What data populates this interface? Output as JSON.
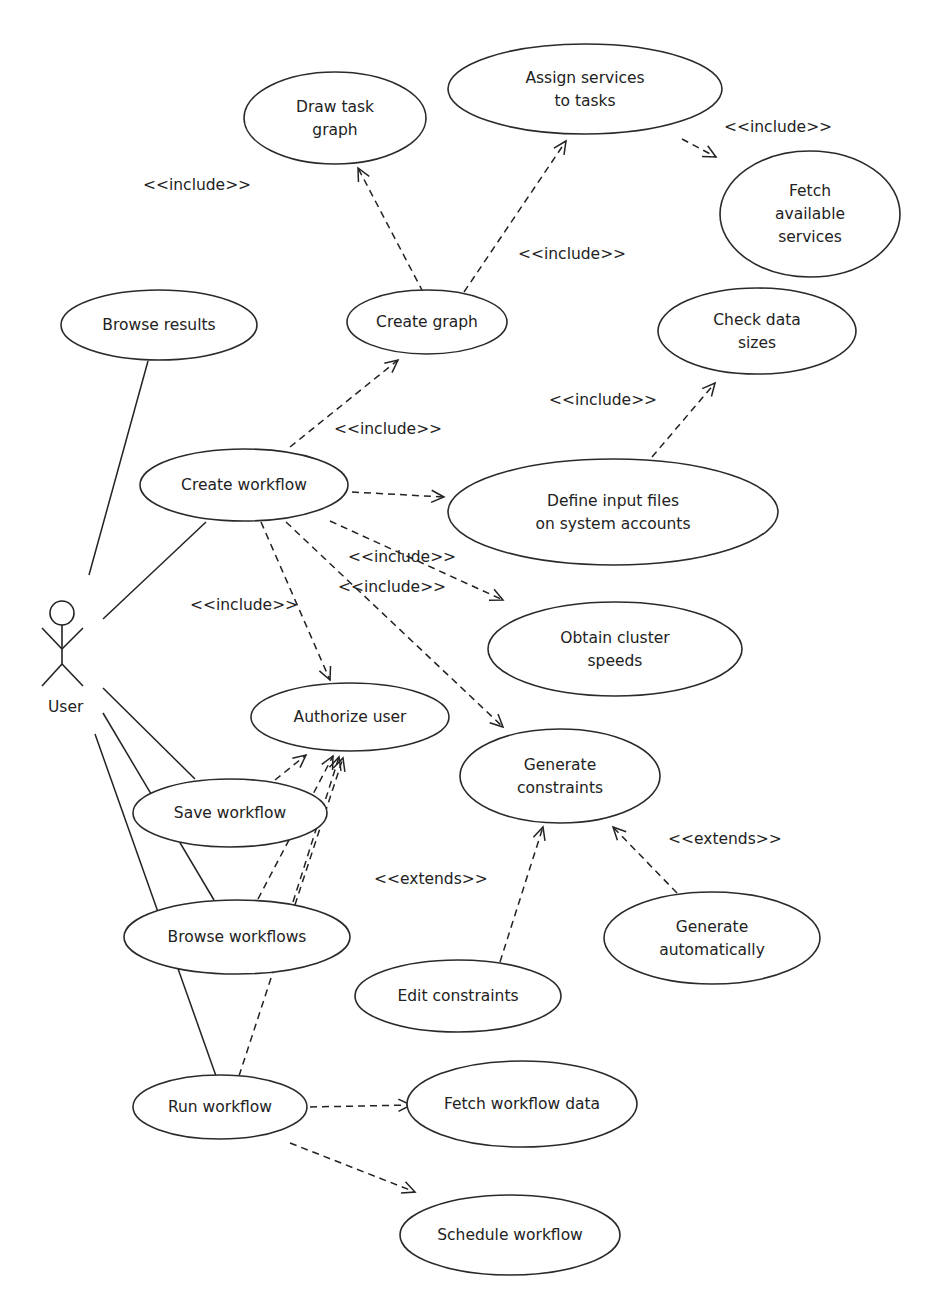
{
  "diagram": {
    "type": "uml-use-case",
    "actor": {
      "id": "user",
      "label": "User",
      "x": 62,
      "y": 640
    },
    "use_cases": [
      {
        "id": "draw_task_graph",
        "lines": [
          "Draw task",
          "graph"
        ],
        "cx": 335,
        "cy": 118,
        "rx": 91,
        "ry": 46
      },
      {
        "id": "assign_services",
        "lines": [
          "Assign services",
          "to tasks"
        ],
        "cx": 585,
        "cy": 89,
        "rx": 137,
        "ry": 45
      },
      {
        "id": "fetch_services",
        "lines": [
          "Fetch",
          "available",
          "services"
        ],
        "cx": 810,
        "cy": 214,
        "rx": 90,
        "ry": 63
      },
      {
        "id": "browse_results",
        "lines": [
          "Browse results"
        ],
        "cx": 159,
        "cy": 325,
        "rx": 98,
        "ry": 35
      },
      {
        "id": "create_graph",
        "lines": [
          "Create graph"
        ],
        "cx": 427,
        "cy": 322,
        "rx": 80,
        "ry": 32
      },
      {
        "id": "check_data_sizes",
        "lines": [
          "Check data",
          "sizes"
        ],
        "cx": 757,
        "cy": 331,
        "rx": 99,
        "ry": 43
      },
      {
        "id": "create_workflow",
        "lines": [
          "Create workflow"
        ],
        "cx": 244,
        "cy": 485,
        "rx": 104,
        "ry": 36
      },
      {
        "id": "define_input_files",
        "lines": [
          "Define input files",
          "on system accounts"
        ],
        "cx": 613,
        "cy": 512,
        "rx": 165,
        "ry": 53
      },
      {
        "id": "obtain_cluster_speeds",
        "lines": [
          "Obtain cluster",
          "speeds"
        ],
        "cx": 615,
        "cy": 649,
        "rx": 127,
        "ry": 47
      },
      {
        "id": "authorize_user",
        "lines": [
          "Authorize user"
        ],
        "cx": 350,
        "cy": 717,
        "rx": 99,
        "ry": 34
      },
      {
        "id": "generate_constraints",
        "lines": [
          "Generate",
          "constraints"
        ],
        "cx": 560,
        "cy": 776,
        "rx": 100,
        "ry": 47
      },
      {
        "id": "save_workflow",
        "lines": [
          "Save workflow"
        ],
        "cx": 230,
        "cy": 813,
        "rx": 97,
        "ry": 34
      },
      {
        "id": "browse_workflows",
        "lines": [
          "Browse workflows"
        ],
        "cx": 237,
        "cy": 937,
        "rx": 113,
        "ry": 37
      },
      {
        "id": "generate_automatically",
        "lines": [
          "Generate",
          "automatically"
        ],
        "cx": 712,
        "cy": 938,
        "rx": 108,
        "ry": 46
      },
      {
        "id": "edit_constraints",
        "lines": [
          "Edit constraints"
        ],
        "cx": 458,
        "cy": 996,
        "rx": 103,
        "ry": 36
      },
      {
        "id": "run_workflow",
        "lines": [
          "Run workflow"
        ],
        "cx": 220,
        "cy": 1107,
        "rx": 87,
        "ry": 32
      },
      {
        "id": "fetch_workflow_data",
        "lines": [
          "Fetch workflow data"
        ],
        "cx": 522,
        "cy": 1104,
        "rx": 115,
        "ry": 43
      },
      {
        "id": "schedule_workflow",
        "lines": [
          "Schedule workflow"
        ],
        "cx": 510,
        "cy": 1235,
        "rx": 110,
        "ry": 40
      }
    ],
    "associations": [
      {
        "from": "user",
        "to": "browse_results",
        "x1": 89,
        "y1": 575,
        "x2": 148,
        "y2": 361
      },
      {
        "from": "user",
        "to": "create_workflow",
        "x1": 103,
        "y1": 619,
        "x2": 206,
        "y2": 522
      },
      {
        "from": "user",
        "to": "save_workflow",
        "x1": 103,
        "y1": 688,
        "x2": 195,
        "y2": 779
      },
      {
        "from": "user",
        "to": "browse_workflows",
        "x1": 103,
        "y1": 713,
        "x2": 214,
        "y2": 900
      },
      {
        "from": "user",
        "to": "run_workflow",
        "x1": 95,
        "y1": 734,
        "x2": 216,
        "y2": 1076
      }
    ],
    "dependencies": [
      {
        "from": "create_graph",
        "to": "draw_task_graph",
        "x1": 423,
        "y1": 292,
        "x2": 358,
        "y2": 168,
        "stereotype": "include"
      },
      {
        "from": "create_graph",
        "to": "assign_services",
        "x1": 464,
        "y1": 292,
        "x2": 566,
        "y2": 141,
        "stereotype": "include"
      },
      {
        "from": "assign_services",
        "to": "fetch_services",
        "x1": 682,
        "y1": 139,
        "x2": 716,
        "y2": 157,
        "stereotype": "include"
      },
      {
        "from": "create_workflow",
        "to": "create_graph",
        "x1": 290,
        "y1": 447,
        "x2": 398,
        "y2": 360,
        "stereotype": "include"
      },
      {
        "from": "define_input_files",
        "to": "check_data_sizes",
        "x1": 652,
        "y1": 457,
        "x2": 715,
        "y2": 383,
        "stereotype": "include"
      },
      {
        "from": "create_workflow",
        "to": "define_input_files",
        "x1": 352,
        "y1": 492,
        "x2": 444,
        "y2": 497,
        "stereotype": "include"
      },
      {
        "from": "create_workflow",
        "to": "obtain_cluster_speeds",
        "x1": 330,
        "y1": 521,
        "x2": 503,
        "y2": 600,
        "stereotype": "include"
      },
      {
        "from": "create_workflow",
        "to": "generate_constraints",
        "x1": 286,
        "y1": 522,
        "x2": 503,
        "y2": 727,
        "stereotype": "include"
      },
      {
        "from": "create_workflow",
        "to": "authorize_user",
        "x1": 261,
        "y1": 522,
        "x2": 330,
        "y2": 680,
        "stereotype": "include"
      },
      {
        "from": "save_workflow",
        "to": "authorize_user",
        "x1": 275,
        "y1": 780,
        "x2": 306,
        "y2": 755,
        "stereotype": "include"
      },
      {
        "from": "browse_workflows",
        "to": "authorize_user",
        "x1": 258,
        "y1": 899,
        "x2": 333,
        "y2": 756,
        "stereotype": "include"
      },
      {
        "from": "browse_workflows",
        "to": "authorize_user",
        "x1": 293,
        "y1": 902,
        "x2": 339,
        "y2": 757,
        "stereotype": "include"
      },
      {
        "from": "run_workflow",
        "to": "authorize_user",
        "x1": 239,
        "y1": 1076,
        "x2": 343,
        "y2": 758,
        "stereotype": "include"
      },
      {
        "from": "edit_constraints",
        "to": "generate_constraints",
        "x1": 500,
        "y1": 962,
        "x2": 543,
        "y2": 827,
        "stereotype": "extends"
      },
      {
        "from": "generate_automatically",
        "to": "generate_constraints",
        "x1": 677,
        "y1": 893,
        "x2": 613,
        "y2": 827,
        "stereotype": "extends"
      },
      {
        "from": "run_workflow",
        "to": "fetch_workflow_data",
        "x1": 310,
        "y1": 1107,
        "x2": 411,
        "y2": 1105,
        "stereotype": "include"
      },
      {
        "from": "run_workflow",
        "to": "schedule_workflow",
        "x1": 290,
        "y1": 1143,
        "x2": 415,
        "y2": 1192,
        "stereotype": "include"
      }
    ],
    "labels": [
      {
        "text": "<<include>>",
        "x": 143,
        "y": 190
      },
      {
        "text": "<<include>>",
        "x": 724,
        "y": 132
      },
      {
        "text": "<<include>>",
        "x": 518,
        "y": 259
      },
      {
        "text": "<<include>>",
        "x": 549,
        "y": 405
      },
      {
        "text": "<<include>>",
        "x": 334,
        "y": 434
      },
      {
        "text": "<<include>>",
        "x": 348,
        "y": 562
      },
      {
        "text": "<<include>>",
        "x": 338,
        "y": 592
      },
      {
        "text": "<<include>>",
        "x": 190,
        "y": 610
      },
      {
        "text": "<<extends>>",
        "x": 668,
        "y": 844
      },
      {
        "text": "<<extends>>",
        "x": 374,
        "y": 884
      }
    ]
  }
}
